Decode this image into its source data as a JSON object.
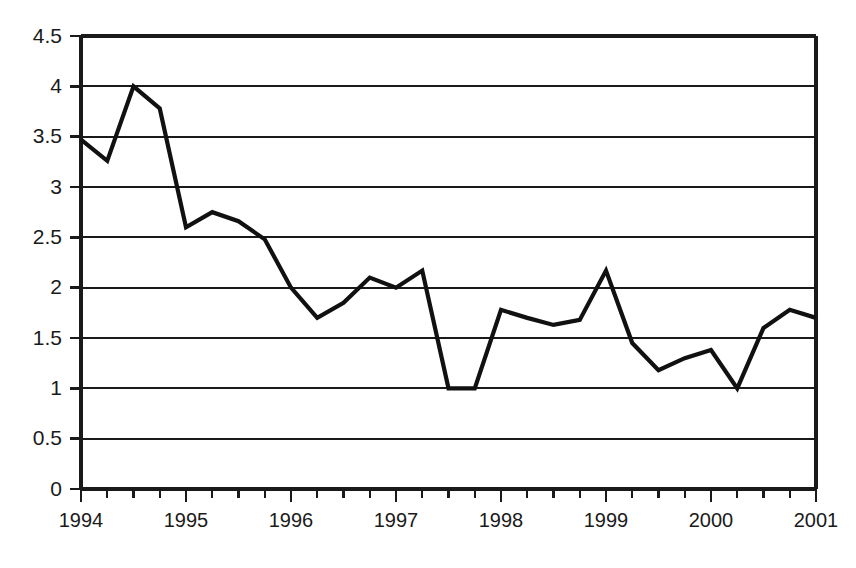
{
  "chart_data": {
    "type": "line",
    "title": "",
    "subtitle": "",
    "xlabel": "",
    "ylabel": "",
    "grid": true,
    "legend": false,
    "legend_position": "none",
    "line_color": "#111111",
    "background_color": "#ffffff",
    "axis_color": "#1a1a1a",
    "xlim": [
      1994,
      2001
    ],
    "ylim": [
      0,
      4.5
    ],
    "y_ticks": [
      0,
      0.5,
      1,
      1.5,
      2,
      2.5,
      3,
      3.5,
      4,
      4.5
    ],
    "y_tick_labels": [
      "0",
      "0.5",
      "1",
      "1.5",
      "2",
      "2.5",
      "3",
      "3.5",
      "4",
      "4.5"
    ],
    "x_ticks": [
      1994,
      1995,
      1996,
      1997,
      1998,
      1999,
      2000,
      2001
    ],
    "x_tick_labels": [
      "1994",
      "1995",
      "1996",
      "1997",
      "1998",
      "1999",
      "2000",
      "2001"
    ],
    "x_minor_tick_interval": 0.25,
    "x": [
      1994.0,
      1994.25,
      1994.5,
      1994.75,
      1995.0,
      1995.25,
      1995.5,
      1995.75,
      1996.0,
      1996.25,
      1996.5,
      1996.75,
      1997.0,
      1997.25,
      1997.5,
      1997.75,
      1998.0,
      1998.25,
      1998.5,
      1998.75,
      1999.0,
      1999.25,
      1999.5,
      1999.75,
      2000.0,
      2000.25,
      2000.5,
      2000.75,
      2001.0
    ],
    "values": [
      3.47,
      3.26,
      4.0,
      3.78,
      2.6,
      2.75,
      2.66,
      2.48,
      2.0,
      1.7,
      1.85,
      2.1,
      2.0,
      2.17,
      1.0,
      1.0,
      1.78,
      1.7,
      1.63,
      1.68,
      2.17,
      1.45,
      1.18,
      1.3,
      1.38,
      1.0,
      1.6,
      1.78,
      1.7
    ],
    "series": [
      {
        "name": "series-1",
        "values": [
          3.47,
          3.26,
          4.0,
          3.78,
          2.6,
          2.75,
          2.66,
          2.48,
          2.0,
          1.7,
          1.85,
          2.1,
          2.0,
          2.17,
          1.0,
          1.0,
          1.78,
          1.7,
          1.63,
          1.68,
          2.17,
          1.45,
          1.18,
          1.3,
          1.38,
          1.0,
          1.6,
          1.78,
          1.7
        ]
      }
    ],
    "annotations": []
  }
}
